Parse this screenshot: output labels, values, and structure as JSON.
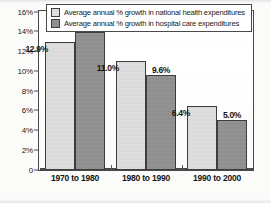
{
  "chart_data": {
    "type": "bar",
    "title": "",
    "xlabel": "",
    "ylabel": "",
    "ylim": [
      0,
      16
    ],
    "grid": false,
    "legend_position": "top",
    "categories": [
      "1970 to 1980",
      "1980 to 1990",
      "1990 to 2000"
    ],
    "ytick_labels": [
      "0",
      "2%",
      "4%",
      "6%",
      "8%",
      "10%",
      "12%",
      "14%",
      "16%"
    ],
    "ytick_values": [
      0,
      2,
      4,
      6,
      8,
      10,
      12,
      14,
      16
    ],
    "series": [
      {
        "name": "Average annual % growth in national health expenditures",
        "color": "#dedede",
        "values": [
          12.9,
          11.0,
          6.4
        ],
        "labels": [
          "12.9%",
          "11.0%",
          "6.4%"
        ]
      },
      {
        "name": "Average annual % growth in hospital care expenditures",
        "color": "#8f8f8f",
        "values": [
          13.9,
          9.6,
          5.0
        ],
        "labels": [
          "13.9%",
          "9.6%",
          "5.0%"
        ]
      }
    ]
  },
  "legend": {
    "items": [
      {
        "label": "Average annual % growth in national health expenditures",
        "swatch": "light"
      },
      {
        "label": "Average annual % growth in hospital care expenditures",
        "swatch": "dark"
      }
    ]
  },
  "colors": {
    "series_light": "#dedede",
    "series_dark": "#8f8f8f",
    "frame": "#4a4a4a",
    "text": "#1a1a1a",
    "background": "#ffffff"
  }
}
